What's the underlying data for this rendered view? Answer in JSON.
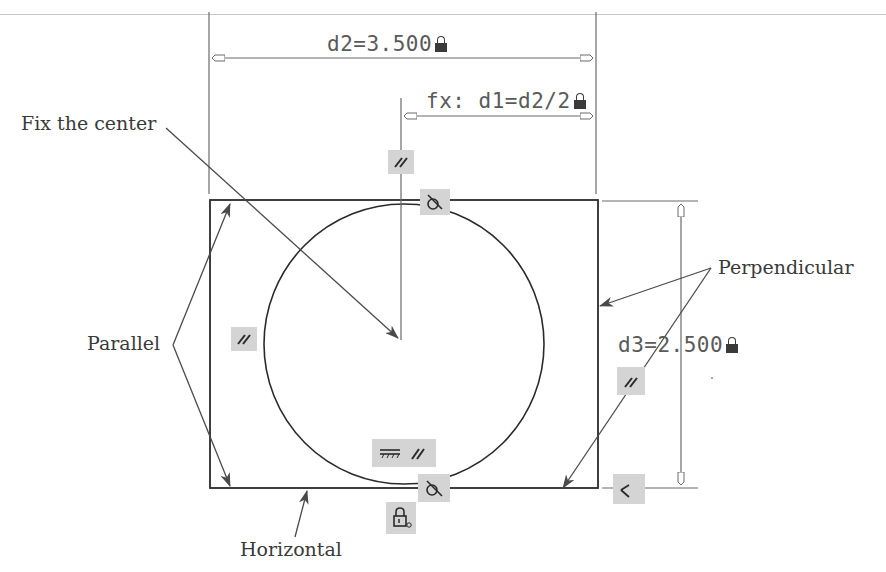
{
  "figure": {
    "dimensions": {
      "d2": {
        "label": "d2=3.500",
        "locked": true
      },
      "d1": {
        "label": "fx: d1=d2/2",
        "locked": true
      },
      "d3": {
        "label": "d3=2.500",
        "locked": true
      }
    },
    "callouts": {
      "fix_center": "Fix the center",
      "parallel": "Parallel",
      "perpendicular": "Perpendicular",
      "horizontal": "Horizontal"
    },
    "constraint_glyphs": [
      {
        "type": "parallel",
        "symbol": "//",
        "location": "above circle top"
      },
      {
        "type": "tangent",
        "symbol": "tangent",
        "location": "circle top"
      },
      {
        "type": "parallel",
        "symbol": "//",
        "location": "left side"
      },
      {
        "type": "parallel",
        "symbol": "//",
        "location": "right side"
      },
      {
        "type": "horizontal",
        "symbol": "horizontal",
        "location": "bottom"
      },
      {
        "type": "parallel",
        "symbol": "//",
        "location": "bottom"
      },
      {
        "type": "tangent",
        "symbol": "tangent",
        "location": "circle bottom"
      },
      {
        "type": "fix",
        "symbol": "lock",
        "location": "below bottom"
      },
      {
        "type": "perpendicular",
        "symbol": "perpendicular",
        "location": "bottom right corner"
      }
    ],
    "colors": {
      "line": "#2a2a2a",
      "dimension_line": "#6a6a6a",
      "leader": "#4a4a4a",
      "glyph_bg": "#d4d4d4",
      "text": "#3a3a3a"
    }
  }
}
